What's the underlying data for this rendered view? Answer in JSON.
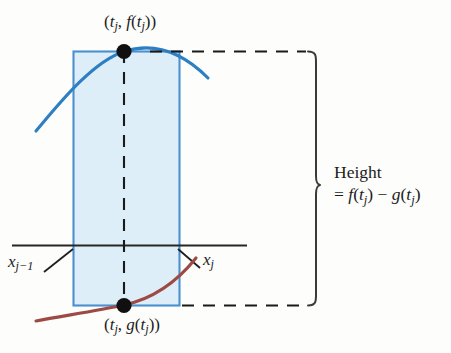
{
  "figure": {
    "kind": "calculus-area-between-curves-diagram",
    "background_color": "#fdfdfb",
    "labels": {
      "top_point": "(tⱼ, f(tⱼ))",
      "bottom_point": "(tⱼ, g(tⱼ))",
      "x_left": "xⱼ₋₁",
      "x_right": "xⱼ",
      "height_line1": "Height",
      "height_line2": "= f(tⱼ) − g(tⱼ)"
    },
    "label_parts": {
      "top_point_plain": "(tj, f(tj))",
      "bottom_point_plain": "(tj, g(tj))",
      "x_left_plain": "xj-1",
      "x_right_plain": "xj",
      "height_expression_plain": "= f(tj) - g(tj)"
    },
    "colors": {
      "upper_curve": "#2d7fc1",
      "lower_curve": "#9c4a43",
      "rect_border": "#4a90cf",
      "rect_fill": "#ddeef8",
      "axis": "#262626",
      "dashed": "#1a1a1a",
      "dot": "#101010",
      "brace": "#3a3a3a",
      "text": "#1c1c1c"
    },
    "geometry": {
      "rect_left": 73,
      "rect_right": 179,
      "rect_top": 51,
      "rect_bottom": 305,
      "vertical_dashed_x": 124,
      "axis_y": 245,
      "axis_left": 12,
      "axis_right": 247,
      "top_dot": [
        124,
        51
      ],
      "bottom_dot": [
        124,
        305
      ],
      "brace_tip_x": 320,
      "brace_tip_y": 185,
      "brace_x": 308,
      "dash_top_y": 51,
      "dash_bottom_y": 305
    },
    "icons": {
      "point_marker": "filled-dot",
      "brace": "right-curly-brace",
      "leader": "leader-line"
    }
  }
}
